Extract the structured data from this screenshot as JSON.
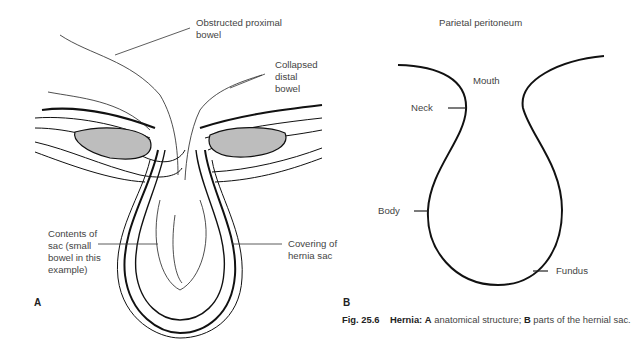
{
  "figure": {
    "number": "Fig. 25.6",
    "caption_title": "Hernia:",
    "caption_a_letter": "A",
    "caption_a_text": " anatomical structure; ",
    "caption_b_letter": "B",
    "caption_b_text": " parts of the hernial sac."
  },
  "panel_a": {
    "letter": "A",
    "labels": {
      "obstructed": "Obstructed proximal\nbowel",
      "collapsed": "Collapsed\ndistal\nbowel",
      "contents": "Contents of\nsac (small\nbowel in this\nexample)",
      "covering": "Covering of\nhernia sac"
    }
  },
  "panel_b": {
    "letter": "B",
    "labels": {
      "parietal": "Parietal peritoneum",
      "mouth": "Mouth",
      "neck": "Neck",
      "body": "Body",
      "fundus": "Fundus"
    }
  }
}
